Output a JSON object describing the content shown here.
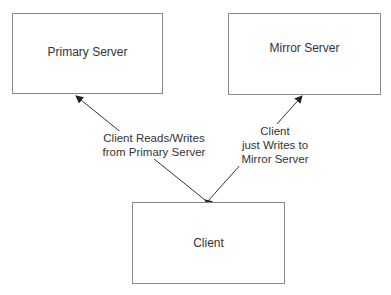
{
  "diagram": {
    "nodes": {
      "primary": {
        "label": "Primary Server"
      },
      "mirror": {
        "label": "Mirror Server"
      },
      "client": {
        "label": "Client"
      }
    },
    "edges": {
      "client_primary": {
        "line1": "Client Reads/Writes",
        "line2": "from Primary Server",
        "direction": "bidirectional"
      },
      "client_mirror": {
        "line1": "Client",
        "line2": "just Writes to",
        "line3": "Mirror Server",
        "direction": "to-mirror"
      }
    },
    "colors": {
      "line": "#333333",
      "border": "#8a8a8a",
      "text": "#333333"
    }
  }
}
